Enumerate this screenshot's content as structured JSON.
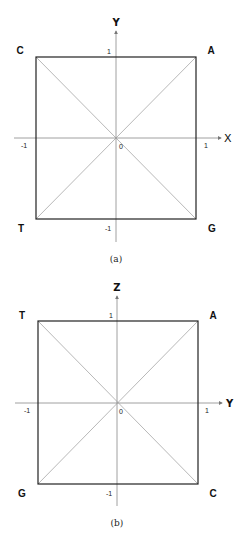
{
  "figures": [
    {
      "id": "a",
      "caption": "(a)",
      "horizontal_axis": "X",
      "vertical_axis": "Y",
      "ticks": {
        "top": "1",
        "bottom": "-1",
        "left": "-1",
        "right": "1",
        "origin": "0"
      },
      "corners": {
        "top_left": "C",
        "top_right": "A",
        "bottom_left": "T",
        "bottom_right": "G"
      }
    },
    {
      "id": "b",
      "caption": "(b)",
      "horizontal_axis": "Y",
      "vertical_axis": "Z",
      "ticks": {
        "top": "1",
        "bottom": "-1",
        "left": "-1",
        "right": "1",
        "origin": "0"
      },
      "corners": {
        "top_left": "T",
        "top_right": "A",
        "bottom_left": "G",
        "bottom_right": "C"
      }
    }
  ],
  "colors": {
    "frame": "#222222",
    "axis": "#888888",
    "diagonal": "#999999"
  }
}
